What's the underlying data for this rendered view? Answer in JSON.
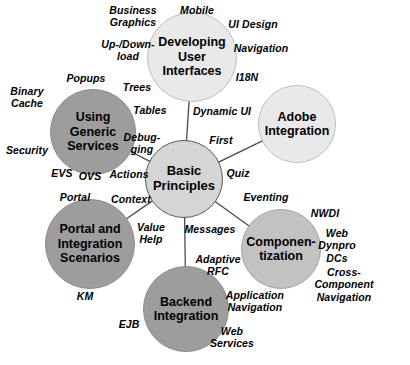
{
  "diagram": {
    "type": "hub-and-spoke mind map",
    "background_color": "#ffffff",
    "colors": {
      "hub_fill": "#d5d5d5",
      "light_fill": "#e9e9e9",
      "medium_fill": "#9d9d9d",
      "midlight_fill": "#c2c2c2",
      "edge_stroke": "#4a4a4a",
      "text": "#000000"
    }
  },
  "hub": {
    "id": "basic-principles",
    "label": "Basic\nPrinciples",
    "cx": 184,
    "cy": 179,
    "r": 39,
    "style": "hub"
  },
  "nodes": [
    {
      "id": "developing-user-interfaces",
      "label": "Developing\nUser\nInterfaces",
      "cx": 192,
      "cy": 57,
      "r": 45,
      "style": "light"
    },
    {
      "id": "adobe-integration",
      "label": "Adobe\nIntegration",
      "cx": 297,
      "cy": 124,
      "r": 39,
      "style": "light"
    },
    {
      "id": "componentization",
      "label": "Componen-\ntization",
      "cx": 281,
      "cy": 249,
      "r": 40,
      "style": "midlight"
    },
    {
      "id": "backend-integration",
      "label": "Backend\nIntegration",
      "cx": 186,
      "cy": 309,
      "r": 43,
      "style": "medium"
    },
    {
      "id": "portal-and-integration-scenarios",
      "label": "Portal and\nIntegration\nScenarios",
      "cx": 90,
      "cy": 244,
      "r": 45,
      "style": "medium"
    },
    {
      "id": "using-generic-services",
      "label": "Using\nGeneric\nServices",
      "cx": 93,
      "cy": 132,
      "r": 43,
      "style": "medium"
    }
  ],
  "edges": [
    {
      "from": "basic-principles",
      "to": "developing-user-interfaces"
    },
    {
      "from": "basic-principles",
      "to": "adobe-integration"
    },
    {
      "from": "basic-principles",
      "to": "componentization"
    },
    {
      "from": "basic-principles",
      "to": "backend-integration"
    },
    {
      "from": "basic-principles",
      "to": "portal-and-integration-scenarios"
    },
    {
      "from": "basic-principles",
      "to": "using-generic-services"
    }
  ],
  "keywords": [
    {
      "id": "kw-business-graphics",
      "text": "Business\nGraphics",
      "x": 133,
      "y": 16,
      "align": "c"
    },
    {
      "id": "kw-mobile",
      "text": "Mobile",
      "x": 197,
      "y": 10,
      "align": "c"
    },
    {
      "id": "kw-ui-design",
      "text": "UI Design",
      "x": 253,
      "y": 24,
      "align": "c"
    },
    {
      "id": "kw-up-download",
      "text": "Up-/Down-\nload",
      "x": 128,
      "y": 50,
      "align": "c"
    },
    {
      "id": "kw-navigation-top",
      "text": "Navigation",
      "x": 261,
      "y": 48,
      "align": "c"
    },
    {
      "id": "kw-i18n",
      "text": "I18N",
      "x": 247,
      "y": 77,
      "align": "c"
    },
    {
      "id": "kw-popups",
      "text": "Popups",
      "x": 86,
      "y": 78,
      "align": "c"
    },
    {
      "id": "kw-trees",
      "text": "Trees",
      "x": 137,
      "y": 87,
      "align": "c"
    },
    {
      "id": "kw-binary-cache",
      "text": "Binary\nCache",
      "x": 27,
      "y": 97,
      "align": "c"
    },
    {
      "id": "kw-tables",
      "text": "Tables",
      "x": 150,
      "y": 110,
      "align": "c"
    },
    {
      "id": "kw-dynamic-ui",
      "text": "Dynamic UI",
      "x": 222,
      "y": 111,
      "align": "c"
    },
    {
      "id": "kw-debugging",
      "text": "Debug-\nging",
      "x": 142,
      "y": 143,
      "align": "c"
    },
    {
      "id": "kw-first",
      "text": "First",
      "x": 221,
      "y": 140,
      "align": "c"
    },
    {
      "id": "kw-security",
      "text": "Security",
      "x": 27,
      "y": 150,
      "align": "c"
    },
    {
      "id": "kw-actions",
      "text": "Actions",
      "x": 129,
      "y": 174,
      "align": "c"
    },
    {
      "id": "kw-quiz",
      "text": "Quiz",
      "x": 238,
      "y": 173,
      "align": "c"
    },
    {
      "id": "kw-evs",
      "text": "EVS",
      "x": 62,
      "y": 173,
      "align": "c"
    },
    {
      "id": "kw-ovs",
      "text": "OVS",
      "x": 90,
      "y": 176,
      "align": "c"
    },
    {
      "id": "kw-context",
      "text": "Context",
      "x": 131,
      "y": 199,
      "align": "c"
    },
    {
      "id": "kw-portal",
      "text": "Portal",
      "x": 75,
      "y": 197,
      "align": "c"
    },
    {
      "id": "kw-eventing",
      "text": "Eventing",
      "x": 266,
      "y": 197,
      "align": "c"
    },
    {
      "id": "kw-nwdi",
      "text": "NWDI",
      "x": 325,
      "y": 213,
      "align": "c"
    },
    {
      "id": "kw-value-help",
      "text": "Value\nHelp",
      "x": 151,
      "y": 233,
      "align": "c"
    },
    {
      "id": "kw-messages",
      "text": "Messages",
      "x": 210,
      "y": 229,
      "align": "c"
    },
    {
      "id": "kw-web-dynpro-dcs",
      "text": "Web\nDynpro\nDCs",
      "x": 337,
      "y": 246,
      "align": "c"
    },
    {
      "id": "kw-adaptive-rfc",
      "text": "Adaptive\nRFC",
      "x": 218,
      "y": 265,
      "align": "c"
    },
    {
      "id": "kw-cross-component-nav",
      "text": "Cross-Component\nNavigation",
      "x": 344,
      "y": 285,
      "align": "c"
    },
    {
      "id": "kw-km",
      "text": "KM",
      "x": 85,
      "y": 296,
      "align": "c"
    },
    {
      "id": "kw-application-navigation",
      "text": "Application\nNavigation",
      "x": 255,
      "y": 301,
      "align": "c"
    },
    {
      "id": "kw-ejb",
      "text": "EJB",
      "x": 129,
      "y": 324,
      "align": "c"
    },
    {
      "id": "kw-web-services",
      "text": "Web\nServices",
      "x": 232,
      "y": 337,
      "align": "c"
    }
  ]
}
